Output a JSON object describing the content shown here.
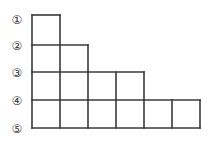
{
  "figure": {
    "name": "staircase-unit-square-diagram",
    "background_color": "#ffffff",
    "line_color": "#3a3a3a",
    "label_color": "#3a3a3a",
    "geometry": {
      "origin_x": 32,
      "origin_y": 15,
      "cell_width": 28,
      "cell_height": 28,
      "row_line_y": [
        15,
        45,
        72,
        100,
        128
      ],
      "column_line_x": [
        32,
        60,
        88,
        116,
        144,
        172,
        200
      ]
    },
    "row_labels": [
      {
        "text": "①",
        "value": 1,
        "x": 9,
        "y": 13
      },
      {
        "text": "②",
        "value": 2,
        "x": 9,
        "y": 39
      },
      {
        "text": "③",
        "value": 3,
        "x": 9,
        "y": 66
      },
      {
        "text": "④",
        "value": 4,
        "x": 9,
        "y": 94
      },
      {
        "text": "⑤",
        "value": 5,
        "x": 9,
        "y": 122
      }
    ],
    "rows": [
      {
        "label": "①–②",
        "cells": 1,
        "top": 15,
        "bottom": 45
      },
      {
        "label": "②–③",
        "cells": 2,
        "top": 45,
        "bottom": 72
      },
      {
        "label": "③–④",
        "cells": 4,
        "top": 72,
        "bottom": 100
      },
      {
        "label": "④—⑤",
        "cells": 6,
        "top": 100,
        "bottom": 128
      }
    ],
    "total_cells": 13
  }
}
